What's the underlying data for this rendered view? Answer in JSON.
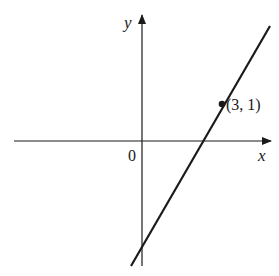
{
  "diagram": {
    "type": "coordinate-plane-line",
    "axes": {
      "x_label": "x",
      "y_label": "y",
      "origin_label": "0"
    },
    "point": {
      "label": "(3, 1)",
      "x": 3,
      "y": 1
    },
    "line": {
      "description": "Straight line with positive slope passing through (3, 1), crossing the x-axis right of the origin and the y-axis below the origin"
    },
    "colors": {
      "ink": "#1a1a1a",
      "background": "#ffffff"
    }
  }
}
